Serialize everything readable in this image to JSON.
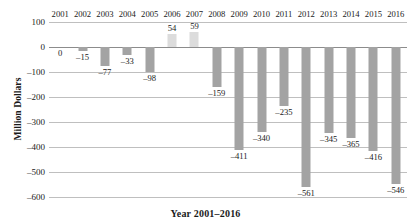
{
  "chart_data": {
    "type": "bar",
    "title": "",
    "xlabel": "Year 2001–2016",
    "ylabel": "Million Dollars",
    "categories": [
      "2001",
      "2002",
      "2003",
      "2004",
      "2005",
      "2006",
      "2007",
      "2008",
      "2009",
      "2010",
      "2011",
      "2012",
      "2013",
      "2014",
      "2015",
      "2016"
    ],
    "values": [
      0,
      -15,
      -77,
      -33,
      -98,
      54,
      59,
      -159,
      -411,
      -340,
      -235,
      -561,
      -345,
      -365,
      -416,
      -546
    ],
    "data_labels": [
      "0",
      "–15",
      "–77",
      "–33",
      "–98",
      "54",
      "59",
      "–159",
      "–411",
      "–340",
      "–235",
      "–561",
      "–345",
      "–365",
      "–416",
      "–546"
    ],
    "ylim": [
      -600,
      100
    ],
    "yticks": [
      100,
      0,
      -100,
      -200,
      -300,
      -400,
      -500,
      -600
    ],
    "ytick_labels": [
      "100",
      "0",
      "–100",
      "–200",
      "–300",
      "–400",
      "–500",
      "–600"
    ],
    "grid": true,
    "legend": "none",
    "category_axis_position": "top",
    "colors": {
      "negative_bar": "#a3a3a3",
      "positive_bar": "#dcdcdc",
      "gridline": "#bfbfbf",
      "zero_line": "#8c8c8c",
      "text": "#1a1a1a"
    }
  }
}
